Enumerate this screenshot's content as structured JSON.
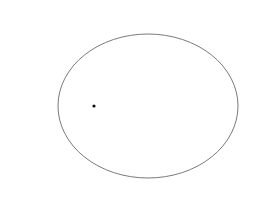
{
  "canvas": {
    "width": 258,
    "height": 206,
    "background": "#ffffff"
  },
  "ellipse": {
    "cx": 148,
    "cy": 106,
    "rx": 90,
    "ry": 72,
    "stroke": "#7a7a7a",
    "stroke_width": 1,
    "fill": "none"
  },
  "point": {
    "cx": 94,
    "cy": 106,
    "r": 1.6,
    "fill": "#111111"
  }
}
